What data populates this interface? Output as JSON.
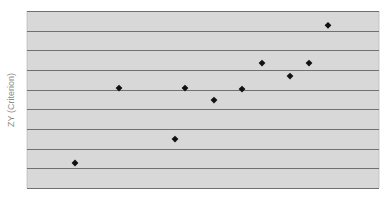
{
  "chart_data": {
    "type": "scatter",
    "title": "",
    "xlabel": "",
    "ylabel": "ZY (Criterion)",
    "grid": true,
    "legend": null,
    "xlim": [
      0,
      352
    ],
    "ylim": [
      0,
      9
    ],
    "gridlines_y": [
      0,
      1,
      2,
      3,
      4,
      5,
      6,
      7,
      8,
      9
    ],
    "points": [
      {
        "x": 48,
        "y": 1.27
      },
      {
        "x": 92,
        "y": 5.08
      },
      {
        "x": 148,
        "y": 2.49
      },
      {
        "x": 158,
        "y": 5.08
      },
      {
        "x": 187,
        "y": 4.47
      },
      {
        "x": 215,
        "y": 5.03
      },
      {
        "x": 235,
        "y": 6.35
      },
      {
        "x": 263,
        "y": 5.69
      },
      {
        "x": 282,
        "y": 6.35
      },
      {
        "x": 301,
        "y": 8.27
      }
    ]
  },
  "style": {
    "plot_background": "#d8d8d8",
    "gridline_color": "#707070",
    "marker_color": "#111111",
    "label_color": "#8c8c8c"
  },
  "layout": {
    "plot_left": 27,
    "plot_top": 11,
    "plot_width": 352,
    "plot_height": 177
  }
}
